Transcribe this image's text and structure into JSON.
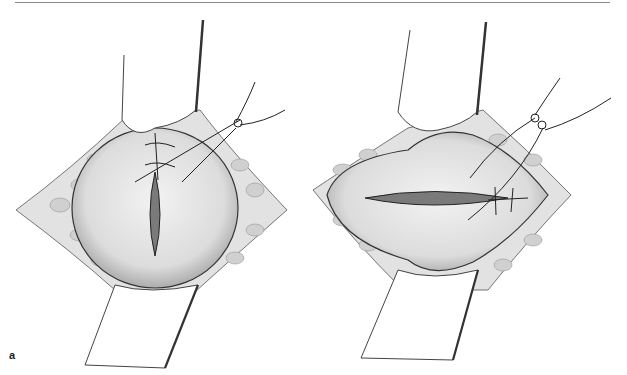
{
  "figure": {
    "panels": [
      {
        "label": "a",
        "description": "Vertical incision with sutures placed at upper end; retractors above and below"
      },
      {
        "label": "b",
        "description": "Horizontal incision with sutures placed at right end; retractors above and below"
      }
    ]
  },
  "colors": {
    "line": "#333333",
    "tissue_fill": "#e6e6e6",
    "fat_fill": "#d4d4d4",
    "incision_fill": "#6e6e6e",
    "background": "#ffffff",
    "rule": "#8a8a8a"
  }
}
